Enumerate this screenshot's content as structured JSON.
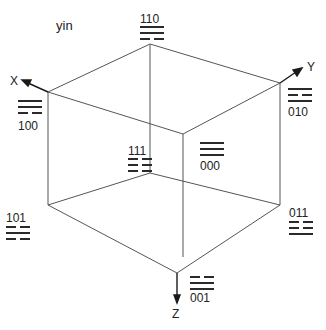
{
  "title": "yin",
  "axes": {
    "x": "X",
    "y": "Y",
    "z": "Z"
  },
  "vertices": [
    {
      "code": "110",
      "lines": [
        "yang",
        "yang",
        "yin"
      ],
      "label_pos": [
        140,
        13
      ],
      "trig_pos": [
        140,
        26
      ]
    },
    {
      "code": "100",
      "lines": [
        "yang",
        "yang",
        "yin"
      ],
      "label_pos": [
        18,
        120
      ],
      "trig_pos": [
        18,
        100
      ]
    },
    {
      "code": "010",
      "lines": [
        "yang",
        "yin",
        "yang"
      ],
      "label_pos": [
        288,
        106
      ],
      "trig_pos": [
        288,
        88
      ]
    },
    {
      "code": "111",
      "lines": [
        "yin",
        "yin",
        "yin"
      ],
      "label_pos": [
        128,
        145
      ],
      "trig_pos": [
        128,
        158
      ]
    },
    {
      "code": "000",
      "lines": [
        "yang",
        "yang",
        "yang"
      ],
      "label_pos": [
        200,
        160
      ],
      "trig_pos": [
        200,
        142
      ]
    },
    {
      "code": "101",
      "lines": [
        "yin",
        "yang",
        "yin"
      ],
      "label_pos": [
        6,
        212
      ],
      "trig_pos": [
        6,
        226
      ]
    },
    {
      "code": "011",
      "lines": [
        "yin",
        "yin",
        "yang"
      ],
      "label_pos": [
        289,
        207
      ],
      "trig_pos": [
        289,
        221
      ]
    },
    {
      "code": "001",
      "lines": [
        "yin",
        "yang",
        "yang"
      ],
      "label_pos": [
        190,
        292
      ],
      "trig_pos": [
        190,
        276
      ]
    }
  ]
}
